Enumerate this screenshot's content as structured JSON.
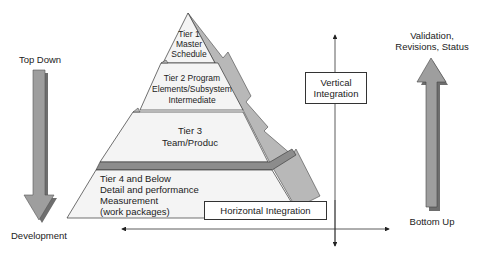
{
  "diagram": {
    "type": "pyramid-integration",
    "colors": {
      "face": "#f2f2f2",
      "side": "#b8b8b8",
      "band": "#8c8c8c",
      "arrow": "#9e9e9e",
      "arrow_shadow": "#6e6e6e",
      "line": "#333333"
    },
    "left_arrow": {
      "direction": "down",
      "top_label": "Top Down",
      "bottom_label": "Development"
    },
    "right_arrow": {
      "direction": "up",
      "top_label_line1": "Validation,",
      "top_label_line2": "Revisions, Status",
      "bottom_label": "Bottom Up"
    },
    "tiers": [
      {
        "id": "tier1",
        "lines": [
          "Tier 1",
          "Master",
          "Schedule"
        ]
      },
      {
        "id": "tier2",
        "lines": [
          "Tier 2 Program",
          "Elements/Subsystem",
          "Intermediate"
        ]
      },
      {
        "id": "tier3",
        "lines": [
          "Tier 3",
          "Team/Produc"
        ]
      },
      {
        "id": "tier4",
        "lines": [
          "Tier 4 and Below",
          "Detail and performance",
          "Measurement",
          "(work packages)"
        ]
      }
    ],
    "vertical_integration": {
      "line1": "Vertical",
      "line2": "Integration"
    },
    "horizontal_integration": {
      "label": "Horizontal Integration"
    }
  }
}
